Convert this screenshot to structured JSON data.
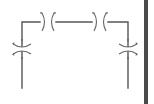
{
  "diagram": {
    "type": "floor-plan-symbol",
    "colors": {
      "wall": "#555555",
      "door_arc": "#666666",
      "background": "#ffffff",
      "side_bar": "#4a4a4a"
    },
    "walls": [
      {
        "name": "top-wall-left",
        "d": "M22 88 L22 58"
      },
      {
        "name": "left-wall-upper",
        "d": "M22 40 L22 22 L40 22"
      },
      {
        "name": "top-wall-mid",
        "d": "M56 22 L92 22"
      },
      {
        "name": "top-wall-right",
        "d": "M108 22 L128 22 L128 40"
      },
      {
        "name": "right-wall-lower",
        "d": "M128 58 L128 88"
      }
    ],
    "doors": [
      {
        "name": "door-top-left",
        "orientation": "vertical-gap",
        "cx": 48,
        "cy": 22
      },
      {
        "name": "door-top-right",
        "orientation": "vertical-gap",
        "cx": 100,
        "cy": 22
      },
      {
        "name": "door-left",
        "orientation": "horizontal-gap",
        "cx": 22,
        "cy": 49
      },
      {
        "name": "door-right",
        "orientation": "horizontal-gap",
        "cx": 128,
        "cy": 49
      }
    ],
    "side_bar": {
      "x": 144,
      "y": 0,
      "width": 4,
      "height": 104
    }
  }
}
